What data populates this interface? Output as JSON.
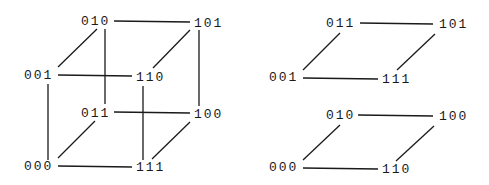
{
  "diagrams": [
    {
      "name": "full-cube",
      "nodes": [
        {
          "id": "010",
          "label": "010",
          "x": 81,
          "y": 22
        },
        {
          "id": "101",
          "label": "101",
          "x": 194,
          "y": 24
        },
        {
          "id": "001",
          "label": "001",
          "x": 24,
          "y": 76
        },
        {
          "id": "110",
          "label": "110",
          "x": 136,
          "y": 78
        },
        {
          "id": "011",
          "label": "011",
          "x": 81,
          "y": 114
        },
        {
          "id": "100",
          "label": "100",
          "x": 194,
          "y": 115
        },
        {
          "id": "000",
          "label": "000",
          "x": 24,
          "y": 167
        },
        {
          "id": "111",
          "label": "111",
          "x": 136,
          "y": 168
        }
      ],
      "edges": [
        {
          "from": "010",
          "to": "101",
          "x1": 114,
          "y1": 21,
          "x2": 190,
          "y2": 22
        },
        {
          "from": "010",
          "to": "001",
          "x1": 97,
          "y1": 29,
          "x2": 58,
          "y2": 67
        },
        {
          "from": "010",
          "to": "011",
          "x1": 105,
          "y1": 29,
          "x2": 105,
          "y2": 104
        },
        {
          "from": "001",
          "to": "110",
          "x1": 58,
          "y1": 75,
          "x2": 132,
          "y2": 76
        },
        {
          "from": "101",
          "to": "110",
          "x1": 190,
          "y1": 30,
          "x2": 153,
          "y2": 68
        },
        {
          "from": "101",
          "to": "100",
          "x1": 199,
          "y1": 30,
          "x2": 199,
          "y2": 106
        },
        {
          "from": "001",
          "to": "000",
          "x1": 48,
          "y1": 84,
          "x2": 48,
          "y2": 160
        },
        {
          "from": "110",
          "to": "111",
          "x1": 143,
          "y1": 86,
          "x2": 143,
          "y2": 160
        },
        {
          "from": "011",
          "to": "100",
          "x1": 114,
          "y1": 112,
          "x2": 190,
          "y2": 113
        },
        {
          "from": "011",
          "to": "000",
          "x1": 95,
          "y1": 121,
          "x2": 58,
          "y2": 158
        },
        {
          "from": "100",
          "to": "111",
          "x1": 190,
          "y1": 122,
          "x2": 152,
          "y2": 159
        },
        {
          "from": "000",
          "to": "111",
          "x1": 58,
          "y1": 166,
          "x2": 132,
          "y2": 167
        }
      ]
    },
    {
      "name": "top-face",
      "nodes": [
        {
          "id": "011",
          "label": "011",
          "x": 326,
          "y": 24
        },
        {
          "id": "101",
          "label": "101",
          "x": 439,
          "y": 25
        },
        {
          "id": "001",
          "label": "001",
          "x": 269,
          "y": 78
        },
        {
          "id": "111",
          "label": "111",
          "x": 382,
          "y": 80
        }
      ],
      "edges": [
        {
          "from": "011",
          "to": "101",
          "x1": 360,
          "y1": 23,
          "x2": 433,
          "y2": 24
        },
        {
          "from": "011",
          "to": "001",
          "x1": 340,
          "y1": 33,
          "x2": 303,
          "y2": 70
        },
        {
          "from": "101",
          "to": "111",
          "x1": 435,
          "y1": 34,
          "x2": 397,
          "y2": 70
        },
        {
          "from": "001",
          "to": "111",
          "x1": 303,
          "y1": 78,
          "x2": 378,
          "y2": 79
        }
      ]
    },
    {
      "name": "bottom-face",
      "nodes": [
        {
          "id": "010",
          "label": "010",
          "x": 326,
          "y": 116
        },
        {
          "id": "100",
          "label": "100",
          "x": 439,
          "y": 117
        },
        {
          "id": "000",
          "label": "000",
          "x": 269,
          "y": 168
        },
        {
          "id": "110",
          "label": "110",
          "x": 382,
          "y": 170
        }
      ],
      "edges": [
        {
          "from": "010",
          "to": "100",
          "x1": 358,
          "y1": 115,
          "x2": 433,
          "y2": 116
        },
        {
          "from": "010",
          "to": "000",
          "x1": 340,
          "y1": 125,
          "x2": 303,
          "y2": 160
        },
        {
          "from": "100",
          "to": "110",
          "x1": 434,
          "y1": 126,
          "x2": 396,
          "y2": 161
        },
        {
          "from": "000",
          "to": "110",
          "x1": 303,
          "y1": 168,
          "x2": 378,
          "y2": 169
        }
      ]
    }
  ]
}
